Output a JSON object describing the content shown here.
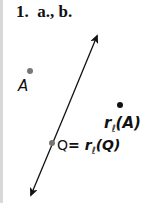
{
  "title": "1.  a., b.",
  "points": {
    "A": {
      "label": "A",
      "x": 30,
      "y": 71,
      "color": "#777777"
    },
    "Q": {
      "label_left": "Q",
      "eq": "= ",
      "r": "r",
      "sub": "ℓ",
      "arg": "(Q)",
      "x": 52,
      "y": 143,
      "color": "#777777"
    },
    "rA": {
      "r": "r",
      "sub": "ℓ",
      "arg": "(A)",
      "x": 120,
      "y": 105,
      "color": "#111111"
    }
  },
  "line": {
    "name": "ℓ",
    "x1": 97,
    "y1": 36,
    "x2": 31,
    "y2": 195
  }
}
